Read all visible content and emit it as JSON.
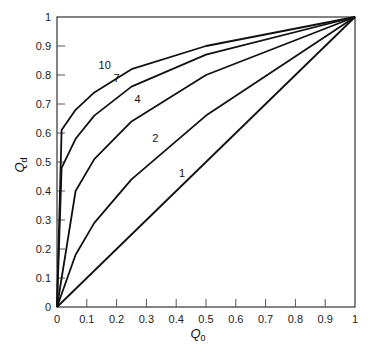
{
  "chart_data": {
    "type": "line",
    "title": "",
    "xlabel": "Q0",
    "ylabel": "Qd",
    "xlabel_main": "Q",
    "xlabel_sub": "0",
    "ylabel_main": "Q",
    "ylabel_sub": "d",
    "xlim": [
      0,
      1
    ],
    "ylim": [
      0,
      1
    ],
    "grid": false,
    "legend": "inline curve labels",
    "x_ticks": [
      "0",
      "0.1",
      "0.2",
      "0.3",
      "0.4",
      "0.5",
      "0.6",
      "0.7",
      "0.8",
      "0.9",
      "1"
    ],
    "y_ticks": [
      "0",
      "0.1",
      "0.2",
      "0.3",
      "0.4",
      "0.5",
      "0.6",
      "0.7",
      "0.8",
      "0.9",
      "1"
    ],
    "series": [
      {
        "name": "1",
        "x": [
          0,
          1
        ],
        "y": [
          0,
          1
        ],
        "label_pos": [
          0.42,
          0.45
        ]
      },
      {
        "name": "2",
        "x": [
          0,
          0.0625,
          0.125,
          0.25,
          0.5,
          1
        ],
        "y": [
          0,
          0.18,
          0.29,
          0.44,
          0.66,
          1
        ],
        "label_pos": [
          0.33,
          0.57
        ]
      },
      {
        "name": "4",
        "x": [
          0,
          0.0625,
          0.125,
          0.25,
          0.5,
          1
        ],
        "y": [
          0,
          0.4,
          0.51,
          0.64,
          0.8,
          1
        ],
        "label_pos": [
          0.27,
          0.705
        ]
      },
      {
        "name": "7",
        "x": [
          0,
          0.0156,
          0.0625,
          0.125,
          0.25,
          0.5,
          1
        ],
        "y": [
          0,
          0.48,
          0.58,
          0.66,
          0.76,
          0.87,
          1
        ],
        "label_pos": [
          0.2,
          0.775
        ]
      },
      {
        "name": "10",
        "x": [
          0,
          0.0156,
          0.0625,
          0.125,
          0.25,
          0.5,
          1
        ],
        "y": [
          0,
          0.61,
          0.68,
          0.74,
          0.82,
          0.9,
          1
        ],
        "label_pos": [
          0.16,
          0.82
        ]
      }
    ]
  }
}
